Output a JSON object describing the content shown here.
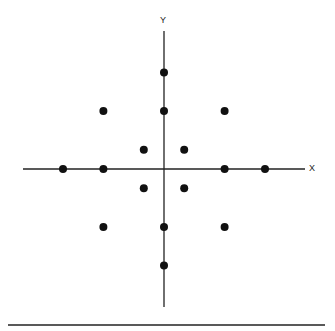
{
  "diagram": {
    "x_axis_label": "X",
    "y_axis_label": "Y",
    "origin_px": [
      164,
      169
    ],
    "unit_px": [
      20.2,
      19.3
    ],
    "point_color": "#111111",
    "axis_color": "#222222"
  },
  "chart_data": {
    "type": "scatter",
    "title": "",
    "xlabel": "X",
    "ylabel": "Y",
    "xlim": [
      -7,
      7
    ],
    "ylim": [
      -7,
      7
    ],
    "grid": false,
    "points": [
      [
        0,
        5
      ],
      [
        -3,
        3
      ],
      [
        0,
        3
      ],
      [
        3,
        3
      ],
      [
        -1,
        1
      ],
      [
        1,
        1
      ],
      [
        -5,
        0
      ],
      [
        -3,
        0
      ],
      [
        3,
        0
      ],
      [
        5,
        0
      ],
      [
        -1,
        -1
      ],
      [
        1,
        -1
      ],
      [
        -3,
        -3
      ],
      [
        0,
        -3
      ],
      [
        3,
        -3
      ],
      [
        0,
        -5
      ]
    ]
  }
}
